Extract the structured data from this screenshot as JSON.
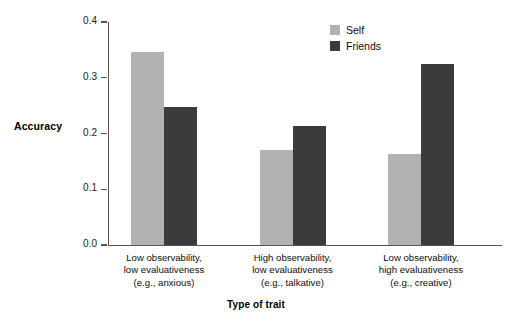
{
  "chart_data": {
    "type": "bar",
    "title": "",
    "xlabel": "Type of trait",
    "ylabel": "Accuracy",
    "ylim": [
      0.0,
      0.4
    ],
    "yticks": [
      "0.0",
      "0.1",
      "0.2",
      "0.3",
      "0.4"
    ],
    "ytick_values": [
      0.0,
      0.1,
      0.2,
      0.3,
      0.4
    ],
    "grid": false,
    "legend_position": "top-right",
    "categories": [
      "Low observability, low evaluativeness (e.g., anxious)",
      "High observability, low evaluativeness (e.g., talkative)",
      "Low observability, high evaluativeness (e.g., creative)"
    ],
    "category_lines": [
      [
        "Low observability,",
        "low evaluativeness",
        "(e.g., anxious)"
      ],
      [
        "High observability,",
        "low evaluativeness",
        "(e.g., talkative)"
      ],
      [
        "Low observability,",
        "high evaluativeness",
        "(e.g., creative)"
      ]
    ],
    "series": [
      {
        "name": "Self",
        "color": "#b2b2b2",
        "values": [
          0.346,
          0.17,
          0.163
        ]
      },
      {
        "name": "Friends",
        "color": "#3b3b3b",
        "values": [
          0.248,
          0.213,
          0.325
        ]
      }
    ]
  },
  "legend": {
    "items": [
      {
        "label": "Self",
        "color": "#b2b2b2"
      },
      {
        "label": "Friends",
        "color": "#3b3b3b"
      }
    ]
  },
  "axis": {
    "y_title": "Accuracy",
    "x_title": "Type of trait"
  }
}
